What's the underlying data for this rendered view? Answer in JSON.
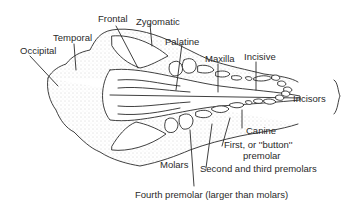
{
  "diagram": {
    "labels": {
      "occipital": "Occipital",
      "temporal": "Temporal",
      "frontal": "Frontal",
      "zygomatic": "Zygomatic",
      "palatine": "Palatine",
      "maxilla": "Maxilla",
      "incisive": "Incisive",
      "incisors": "Incisors",
      "canine": "Canine",
      "first_premolar_line1": "First, or ''button''",
      "first_premolar_line2": "premolar",
      "second_third_premolars": "Second and third premolars",
      "molars": "Molars",
      "fourth_premolar": "Fourth premolar (larger than molars)"
    },
    "colors": {
      "ink": "#2a2a2a",
      "background": "#ffffff",
      "stipple": "#555555"
    }
  }
}
